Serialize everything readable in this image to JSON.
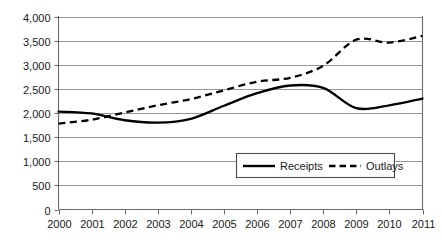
{
  "chart_data": {
    "type": "line",
    "title": "",
    "subtitle": "",
    "xlabel": "",
    "ylabel": "",
    "categories": [
      "2000",
      "2001",
      "2002",
      "2003",
      "2004",
      "2005",
      "2006",
      "2007",
      "2008",
      "2009",
      "2010",
      "2011"
    ],
    "x": [
      2000,
      2001,
      2002,
      2003,
      2004,
      2005,
      2006,
      2007,
      2008,
      2009,
      2010,
      2011
    ],
    "series": [
      {
        "name": "Receipts",
        "style": "solid",
        "values": [
          2030,
          1990,
          1850,
          1800,
          1880,
          2150,
          2410,
          2570,
          2520,
          2100,
          2160,
          2300
        ]
      },
      {
        "name": "Outlays",
        "style": "dashed",
        "values": [
          1780,
          1860,
          2010,
          2160,
          2290,
          2470,
          2650,
          2730,
          2980,
          3520,
          3460,
          3600
        ]
      }
    ],
    "ylim": [
      0,
      4000
    ],
    "ytick_step": 500,
    "ytick_labels": [
      "0",
      "500",
      "1,000",
      "1,500",
      "2,000",
      "2,500",
      "3,000",
      "3,500",
      "4,000"
    ],
    "ytick_values": [
      0,
      500,
      1000,
      1500,
      2000,
      2500,
      3000,
      3500,
      4000
    ],
    "grid": true,
    "grid_axis": "y",
    "legend_position": "inside-lower-right",
    "legend_entries": [
      "Receipts",
      "Outlays"
    ],
    "colors": {
      "receipts_line": "#000000",
      "outlays_line": "#000000",
      "gridline": "#8c8c8c",
      "frame": "#6b6b6b",
      "text": "#1a1a1a",
      "background": "#ffffff"
    }
  }
}
